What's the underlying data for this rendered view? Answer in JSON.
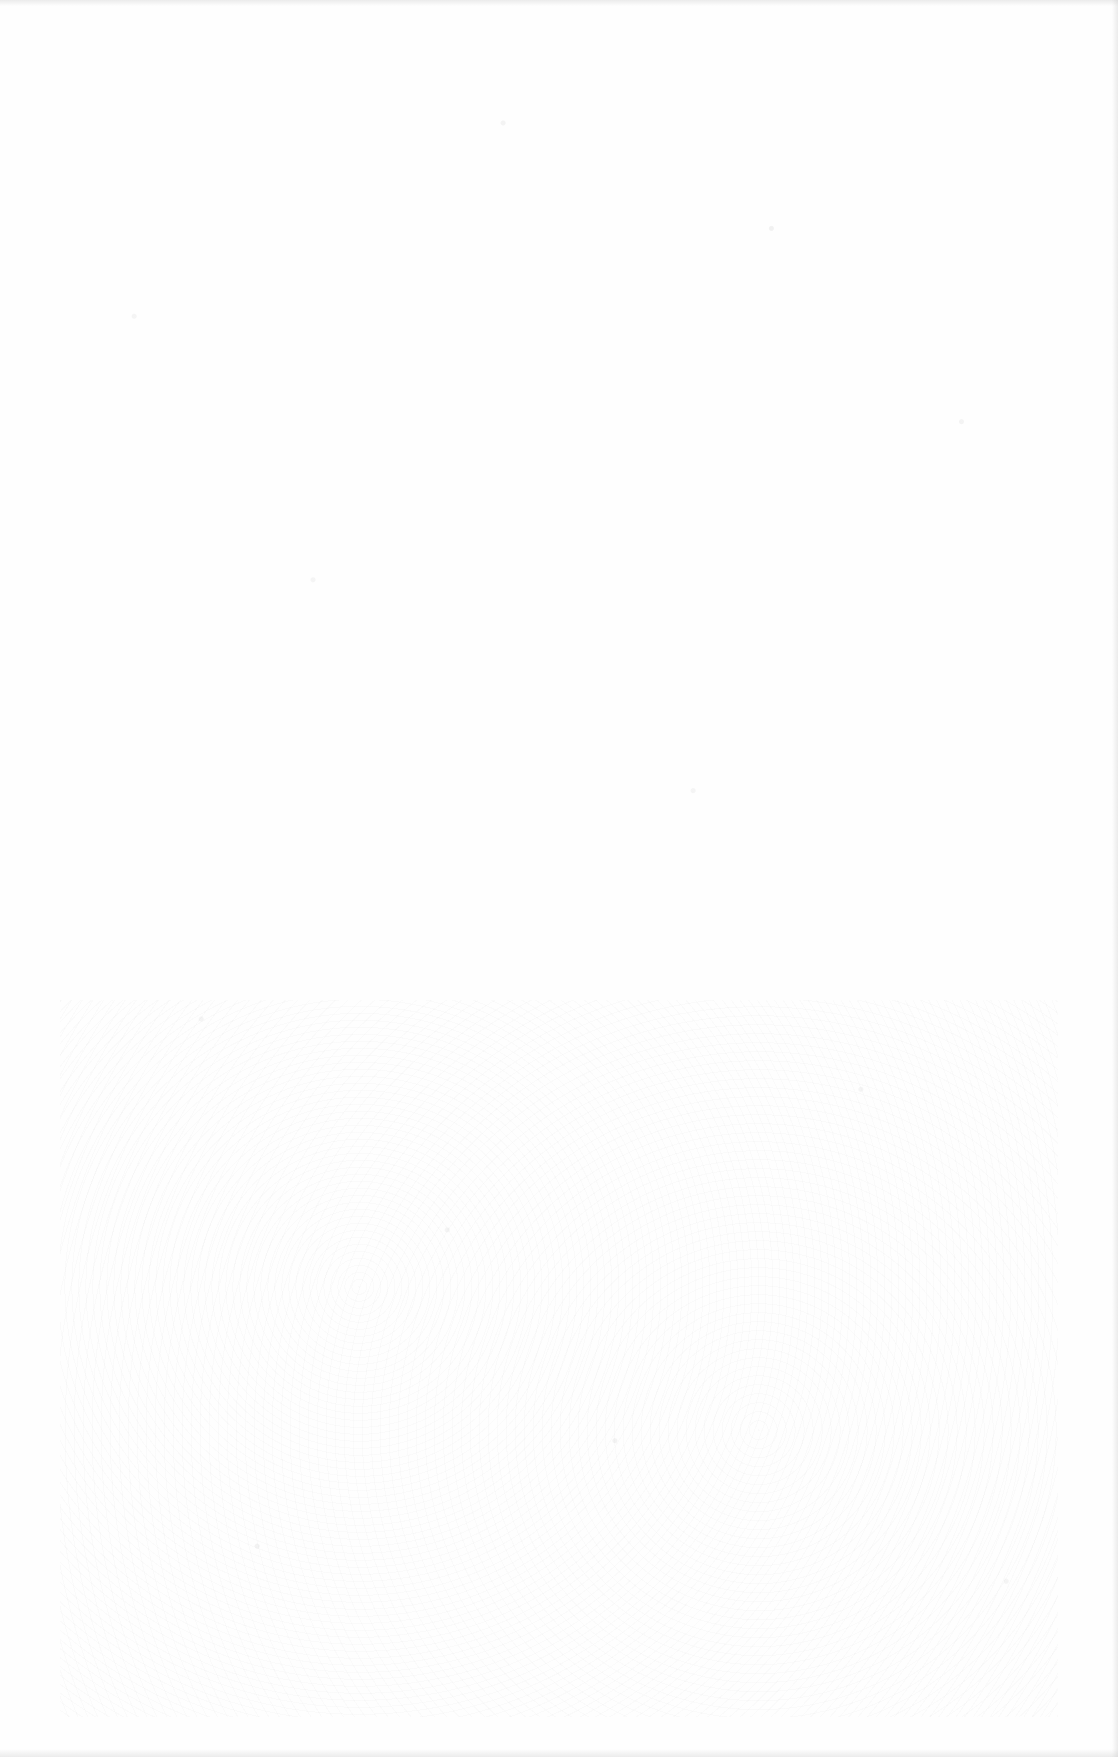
{
  "document": {
    "type": "blank-scanned-page",
    "text": "",
    "background_color": "#fefefe"
  }
}
